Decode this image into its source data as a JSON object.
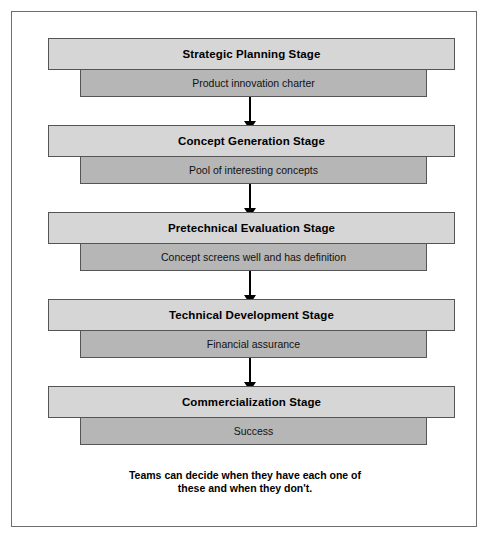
{
  "diagram": {
    "border_color": "#6e6e6e",
    "background_color": "#ffffff",
    "stage_bar_color": "#d6d6d6",
    "outcome_bar_color": "#b6b6b6",
    "arrow_color": "#000000",
    "stages": [
      {
        "title": "Strategic Planning Stage",
        "outcome": "Product innovation charter"
      },
      {
        "title": "Concept Generation Stage",
        "outcome": "Pool of interesting concepts"
      },
      {
        "title": "Pretechnical Evaluation Stage",
        "outcome": "Concept screens well and has definition"
      },
      {
        "title": "Technical Development Stage",
        "outcome": "Financial assurance"
      },
      {
        "title": "Commercialization Stage",
        "outcome": "Success"
      }
    ],
    "arrows": [
      {
        "from": "Strategic Planning Stage",
        "to": "Concept Generation Stage"
      },
      {
        "from": "Concept Generation Stage",
        "to": "Pretechnical Evaluation Stage"
      },
      {
        "from": "Pretechnical Evaluation Stage",
        "to": "Technical Development Stage"
      },
      {
        "from": "Technical Development Stage",
        "to": "Commercialization Stage"
      }
    ],
    "caption": {
      "line1": "Teams can decide when they have each one of",
      "line2": "these and when they don't."
    }
  }
}
